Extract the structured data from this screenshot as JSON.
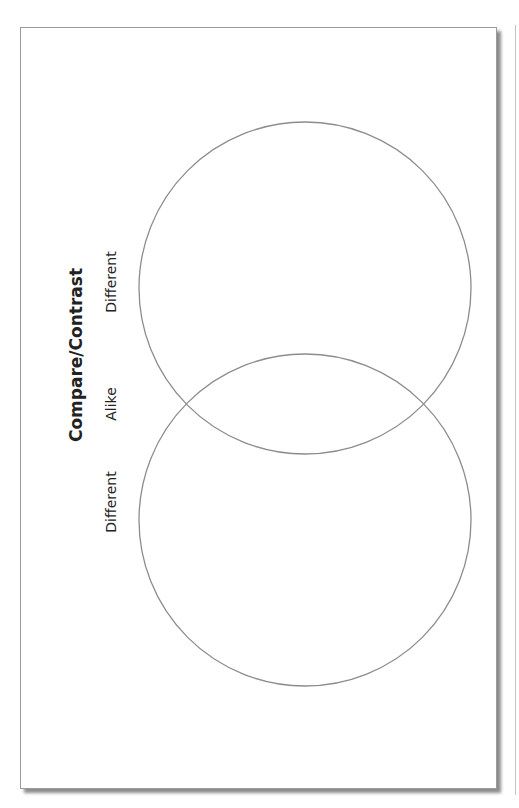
{
  "worksheet": {
    "title": "Compare/Contrast",
    "labels": {
      "different_top": "Different",
      "alike": "Alike",
      "different_bottom": "Different"
    },
    "colors": {
      "circle_stroke": "#8c8c8c",
      "frame_border": "#9a9a9a",
      "text": "#222222"
    }
  }
}
